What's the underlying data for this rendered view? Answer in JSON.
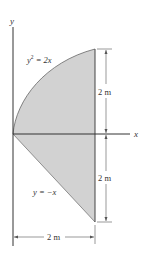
{
  "figure": {
    "axes": {
      "x_label": "x",
      "y_label": "y"
    },
    "curves": [
      {
        "id": "parabola",
        "equation": "y² = 2x",
        "label_main": "y",
        "label_sup": "2",
        "label_rest": " = 2x"
      },
      {
        "id": "line",
        "equation": "y = −x",
        "label": "y = −x"
      }
    ],
    "dimensions": {
      "upper_height": "2 m",
      "lower_height": "2 m",
      "width": "2 m"
    },
    "colors": {
      "fill": "#cfcfcf",
      "stroke": "#555555",
      "axis": "#444444"
    }
  }
}
